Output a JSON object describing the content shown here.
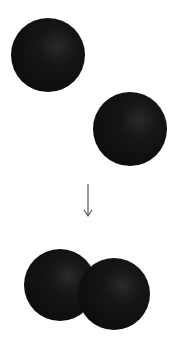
{
  "diagram": {
    "background": "#ffffff",
    "sphere_color": "#121212",
    "sphere_highlight": "#2a2a2a",
    "arrow_color": "#555555",
    "before": {
      "spheres": [
        {
          "cx": 48,
          "cy": 55,
          "r": 37
        },
        {
          "cx": 130,
          "cy": 129,
          "r": 37
        }
      ]
    },
    "arrow": {
      "x": 88,
      "y1": 184,
      "y2": 216,
      "direction": "down"
    },
    "after": {
      "spheres": [
        {
          "cx": 60,
          "cy": 285,
          "r": 36
        },
        {
          "cx": 114,
          "cy": 294,
          "r": 36
        }
      ]
    }
  }
}
